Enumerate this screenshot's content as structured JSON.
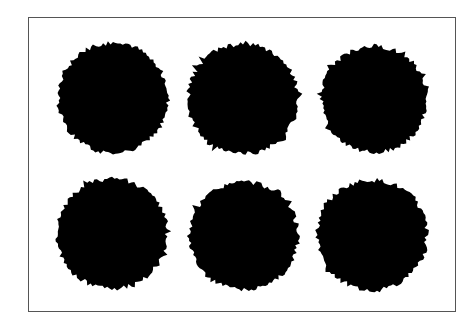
{
  "figure": {
    "frame": {
      "x": 28,
      "y": 17,
      "width": 428,
      "height": 295,
      "border_color": "#555555"
    },
    "background_color": "#ffffff",
    "blob_color": "#000000",
    "blobs": [
      {
        "cx": 113,
        "cy": 98,
        "r": 55,
        "seed": 1
      },
      {
        "cx": 243,
        "cy": 99,
        "r": 55,
        "seed": 2
      },
      {
        "cx": 374,
        "cy": 99,
        "r": 53,
        "seed": 3
      },
      {
        "cx": 112,
        "cy": 234,
        "r": 55,
        "seed": 4
      },
      {
        "cx": 244,
        "cy": 236,
        "r": 54,
        "seed": 5
      },
      {
        "cx": 372,
        "cy": 235,
        "r": 55,
        "seed": 6
      }
    ],
    "layout": {
      "rows": 2,
      "cols": 3
    }
  }
}
